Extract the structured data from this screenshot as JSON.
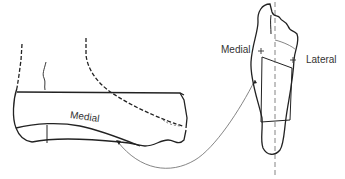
{
  "diagram": {
    "side_view": {
      "label": "Medial"
    },
    "sole_view": {
      "label_left": "Medial",
      "label_right": "Lateral",
      "markers": [
        "+",
        "+"
      ]
    },
    "colors": {
      "stroke": "#222222",
      "thin_stroke": "#555555",
      "background": "#ffffff"
    }
  }
}
